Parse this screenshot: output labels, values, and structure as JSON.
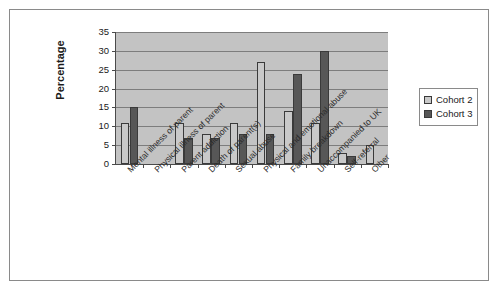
{
  "chart_data": {
    "type": "bar",
    "title": "",
    "xlabel": "",
    "ylabel": "Percentage",
    "ylim": [
      0,
      35
    ],
    "yticks": [
      0,
      5,
      10,
      15,
      20,
      25,
      30,
      35
    ],
    "grid": true,
    "legend_position": "right",
    "categories": [
      "Mental illness of parent",
      "Physical illness of parent",
      "Parent addiction",
      "Death of parent(s)",
      "Sexual abuse",
      "Physical and emotional abuse",
      "Family breakdown",
      "Unaccompanied to UK",
      "Self-referral",
      "Other"
    ],
    "series": [
      {
        "name": "Cohort 2",
        "color": "#c9c9c9",
        "values": [
          11,
          0,
          11,
          8,
          11,
          27,
          14,
          11,
          3,
          5
        ]
      },
      {
        "name": "Cohort 3",
        "color": "#575757",
        "values": [
          15,
          0,
          7,
          7,
          8,
          8,
          24,
          30,
          2,
          0
        ]
      }
    ]
  },
  "legend": {
    "entries": [
      {
        "label": "Cohort 2"
      },
      {
        "label": "Cohort 3"
      }
    ]
  },
  "axis": {
    "y_title": "Percentage"
  }
}
